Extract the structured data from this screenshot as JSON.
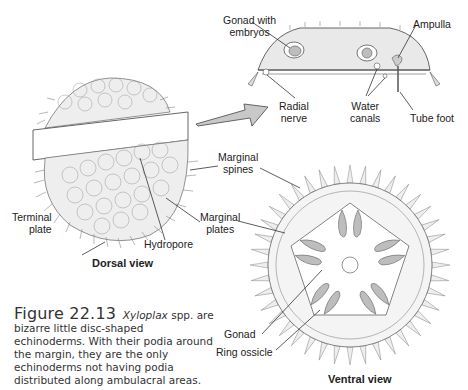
{
  "figure": {
    "number": "Figure 22.13",
    "genus": "Xyloplax",
    "caption_after_genus": " spp. are bizarre little disc-shaped echinoderms. With their podia around the margin, they are the only echinoderms not having podia distributed along ambulacral areas."
  },
  "views": {
    "dorsal": "Dorsal view",
    "ventral": "Ventral view"
  },
  "labels": {
    "gonad_with_embryos_1": "Gonad with",
    "gonad_with_embryos_2": "embryos",
    "ampulla": "Ampulla",
    "radial_nerve_1": "Radial",
    "radial_nerve_2": "nerve",
    "water_canals_1": "Water",
    "water_canals_2": "canals",
    "tube_foot": "Tube foot",
    "marginal_spines_1": "Marginal",
    "marginal_spines_2": "spines",
    "marginal_plates_1": "Marginal",
    "marginal_plates_2": "plates",
    "terminal_plate_1": "Terminal",
    "terminal_plate_2": "plate",
    "hydropore": "Hydropore",
    "gonad": "Gonad",
    "ring_ossicle": "Ring ossicle"
  },
  "colors": {
    "line": "#444444",
    "fill_light": "#ececec",
    "fill_gonad": "#bdbdbd",
    "arrow_fill": "#c8c8c8"
  }
}
